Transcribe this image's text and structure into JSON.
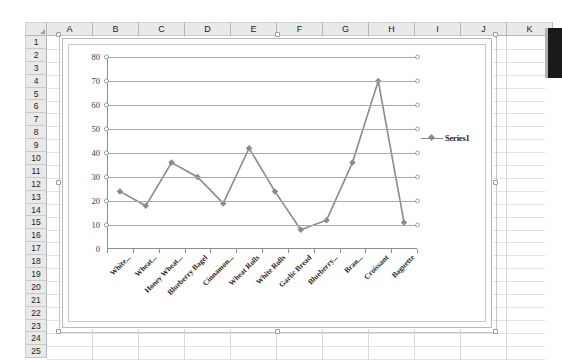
{
  "app": {
    "name": "spreadsheet-chart-view"
  },
  "sheet": {
    "column_headers": [
      "A",
      "B",
      "C",
      "D",
      "E",
      "F",
      "G",
      "H",
      "I",
      "J",
      "K"
    ],
    "row_headers": [
      "1",
      "2",
      "3",
      "4",
      "5",
      "6",
      "7",
      "8",
      "9",
      "10",
      "11",
      "12",
      "13",
      "14",
      "15",
      "16",
      "17",
      "18",
      "19",
      "20",
      "21",
      "22",
      "23",
      "24",
      "25"
    ],
    "select_all_icon": "select-all-triangle"
  },
  "chart": {
    "legend_label": "Series1",
    "legend_marker": "diamond-marker",
    "line_color": "#8b8b8b",
    "gridline_color": "#a9a9a9",
    "axis_color": "#8f8f8f"
  },
  "chart_data": {
    "type": "line",
    "title": "",
    "xlabel": "",
    "ylabel": "",
    "ylim": [
      0,
      80
    ],
    "yticks": [
      0,
      10,
      20,
      30,
      40,
      50,
      60,
      70,
      80
    ],
    "grid": true,
    "legend_position": "right",
    "categories": [
      "White...",
      "Wheat...",
      "Honey Wheat...",
      "Blueberry Bagel",
      "Cinnamon...",
      "Wheat Rolls",
      "White Rolls",
      "Garlic Bread",
      "Blueberry...",
      "Bran...",
      "Croissant",
      "Baguette"
    ],
    "series": [
      {
        "name": "Series1",
        "values": [
          24,
          18,
          36,
          30,
          19,
          42,
          24,
          8,
          12,
          36,
          70,
          11
        ]
      }
    ]
  }
}
